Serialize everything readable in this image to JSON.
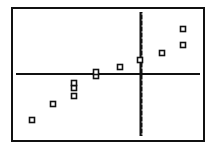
{
  "chart_data": {
    "type": "scatter",
    "title": "",
    "xlabel": "",
    "ylabel": "",
    "grid": false,
    "legend": null,
    "marker": "hollow-square",
    "axes": {
      "x_axis_screen_y": 74,
      "y_axis_screen_x": 141,
      "y_axis_ticks": true,
      "tick_spacing_px": 6
    },
    "xlim": [
      -21,
      10.5
    ],
    "ylim": [
      -11,
      11
    ],
    "points": [
      {
        "x": -18.2,
        "y": -7.7
      },
      {
        "x": -14.7,
        "y": -5.0
      },
      {
        "x": -11.2,
        "y": -3.7
      },
      {
        "x": -11.2,
        "y": -2.3
      },
      {
        "x": -11.2,
        "y": -1.5
      },
      {
        "x": -7.5,
        "y": -0.3
      },
      {
        "x": -7.5,
        "y": 0.3
      },
      {
        "x": -3.5,
        "y": 1.2
      },
      {
        "x": -0.2,
        "y": 2.3
      },
      {
        "x": 3.5,
        "y": 3.5
      },
      {
        "x": 7.0,
        "y": 4.8
      },
      {
        "x": 7.0,
        "y": 7.5
      }
    ],
    "screen_points": [
      [
        32,
        120
      ],
      [
        53,
        104
      ],
      [
        74,
        96
      ],
      [
        74,
        88
      ],
      [
        74,
        83
      ],
      [
        96,
        76
      ],
      [
        96,
        72
      ],
      [
        120,
        67
      ],
      [
        140,
        60
      ],
      [
        162,
        53
      ],
      [
        183,
        45
      ],
      [
        183,
        29
      ]
    ]
  },
  "frame": {
    "left": 12,
    "top": 8,
    "right": 204,
    "bottom": 141,
    "color": "#111111"
  }
}
